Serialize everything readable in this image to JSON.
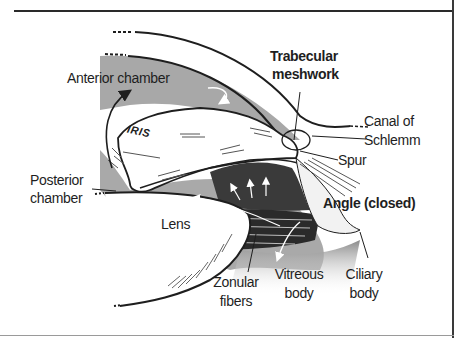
{
  "figure": {
    "labels": {
      "anterior_chamber": "Anterior chamber",
      "trabecular_meshwork_1": "Trabecular",
      "trabecular_meshwork_2": "meshwork",
      "canal_of_schlemm_1": "Canal of",
      "canal_of_schlemm_2": "Schlemm",
      "spur": "Spur",
      "iris": "IRIS",
      "posterior_chamber_1": "Posterior",
      "posterior_chamber_2": "chamber",
      "lens": "Lens",
      "angle": "Angle (closed)",
      "zonular_fibers_1": "Zonular",
      "zonular_fibers_2": "fibers",
      "vitreous_body_1": "Vitreous",
      "vitreous_body_2": "body",
      "ciliary_body_1": "Ciliary",
      "ciliary_body_2": "body"
    },
    "colors": {
      "ink": "#1e1e1e",
      "chamber_gray": "#9c9c9c",
      "ciliary_dark": "#3a3a3a",
      "background": "#ffffff"
    }
  }
}
